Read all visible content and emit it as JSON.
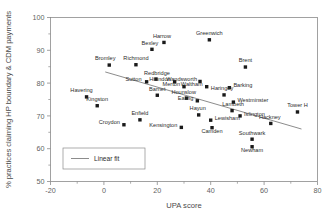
{
  "chart_data": {
    "type": "scatter",
    "title": "",
    "xlabel": "UPA score",
    "ylabel": "% practices claiming HP boundary & CDM payments",
    "xlim": [
      -20,
      80
    ],
    "ylim": [
      50,
      100
    ],
    "xticks": [
      -20,
      0,
      20,
      40,
      60,
      80
    ],
    "xtick_labels": [
      "-20",
      "0",
      "20",
      "40",
      "60",
      "80"
    ],
    "xminor": [
      -10,
      10,
      30,
      50,
      70
    ],
    "yticks": [
      50,
      60,
      70,
      80,
      90,
      100
    ],
    "ytick_labels": [
      "50",
      "60",
      "70",
      "80",
      "90",
      "100"
    ],
    "yminor": [
      55,
      65,
      75,
      85,
      95
    ],
    "grid": false,
    "legend": {
      "position": "lower-left",
      "entries": [
        {
          "label": "Linear fit",
          "marker": "line",
          "color": "#6e6e6e"
        }
      ]
    },
    "marker_style": {
      "shape": "square",
      "color": "#1a1a1a",
      "size": 3.4
    },
    "points": [
      {
        "name": "Harrow",
        "x": 22.5,
        "y": 92.4,
        "label_dx": -2,
        "label_dy": -4.6,
        "anchor": "middle"
      },
      {
        "name": "Bexley",
        "x": 18.0,
        "y": 90.3,
        "label_dx": -2,
        "label_dy": -4.6,
        "anchor": "middle"
      },
      {
        "name": "Greenwich",
        "x": 39.5,
        "y": 93.2,
        "label_dx": 0,
        "label_dy": -4.6,
        "anchor": "middle"
      },
      {
        "name": "Richmond",
        "x": 12.0,
        "y": 85.6,
        "label_dx": 0,
        "label_dy": -4.6,
        "anchor": "middle"
      },
      {
        "name": "Bromley",
        "x": 2.0,
        "y": 85.5,
        "label_dx": -4,
        "label_dy": -4.6,
        "anchor": "middle"
      },
      {
        "name": "Brent",
        "x": 53.0,
        "y": 84.9,
        "label_dx": 0,
        "label_dy": -4.6,
        "anchor": "middle"
      },
      {
        "name": "Redbridge",
        "x": 19.5,
        "y": 81.2,
        "label_dx": 1,
        "label_dy": -4.6,
        "anchor": "middle"
      },
      {
        "name": "Sutton",
        "x": 16.0,
        "y": 80.4,
        "label_dx": -5,
        "label_dy": -0.4,
        "anchor": "end"
      },
      {
        "name": "Hillindon",
        "x": 26.5,
        "y": 80.4,
        "label_dx": -4,
        "label_dy": -0.4,
        "anchor": "end"
      },
      {
        "name": "Wandsworth",
        "x": 36.0,
        "y": 80.5,
        "label_dx": -3,
        "label_dy": -0.4,
        "anchor": "end"
      },
      {
        "name": "Merton",
        "x": 30.0,
        "y": 78.9,
        "label_dx": -4,
        "label_dy": -0.4,
        "anchor": "end"
      },
      {
        "name": "Waltham",
        "x": 38.5,
        "y": 78.9,
        "label_dx": -4,
        "label_dy": -0.4,
        "anchor": "end"
      },
      {
        "name": "Barking",
        "x": 47.0,
        "y": 78.6,
        "label_dx": 4,
        "label_dy": -0.4,
        "anchor": "start"
      },
      {
        "name": "Barnet",
        "x": 20.0,
        "y": 76.3,
        "label_dx": 0,
        "label_dy": -4.6,
        "anchor": "middle"
      },
      {
        "name": "Hounslow",
        "x": 31.0,
        "y": 75.4,
        "label_dx": -3,
        "label_dy": -4.6,
        "anchor": "middle"
      },
      {
        "name": "Ealing",
        "x": 35.0,
        "y": 74.6,
        "label_dx": -4,
        "label_dy": -0.4,
        "anchor": "end"
      },
      {
        "name": "Haringey",
        "x": 45.0,
        "y": 76.4,
        "label_dx": -2,
        "label_dy": -4.6,
        "anchor": "middle"
      },
      {
        "name": "Westminster",
        "x": 48.5,
        "y": 74.2,
        "label_dx": 4,
        "label_dy": -0.4,
        "anchor": "start"
      },
      {
        "name": "Havering",
        "x": -6.5,
        "y": 75.8,
        "label_dx": -5,
        "label_dy": -4.6,
        "anchor": "middle"
      },
      {
        "name": "Kingston",
        "x": -2.5,
        "y": 73.1,
        "label_dx": 0,
        "label_dy": -4.6,
        "anchor": "middle"
      },
      {
        "name": "Enfield",
        "x": 13.5,
        "y": 68.8,
        "label_dx": 0,
        "label_dy": -4.6,
        "anchor": "middle"
      },
      {
        "name": "Croydon",
        "x": 7.5,
        "y": 67.3,
        "label_dx": -4,
        "label_dy": -0.4,
        "anchor": "end"
      },
      {
        "name": "Kensington",
        "x": 29.0,
        "y": 66.5,
        "label_dx": -4,
        "label_dy": -0.4,
        "anchor": "end"
      },
      {
        "name": "Hayun",
        "x": 35.5,
        "y": 70.3,
        "label_dx": -1,
        "label_dy": -4.6,
        "anchor": "middle"
      },
      {
        "name": "Lewisham",
        "x": 40.0,
        "y": 68.7,
        "label_dx": 4,
        "label_dy": -0.4,
        "anchor": "start"
      },
      {
        "name": "Camden",
        "x": 40.5,
        "y": 66.4,
        "label_dx": 0,
        "label_dy": 5.4,
        "anchor": "middle"
      },
      {
        "name": "Lambeth",
        "x": 48.0,
        "y": 71.6,
        "label_dx": 1,
        "label_dy": -4.6,
        "anchor": "middle"
      },
      {
        "name": "Islington",
        "x": 51.0,
        "y": 70.0,
        "label_dx": 4,
        "label_dy": -0.4,
        "anchor": "start"
      },
      {
        "name": "Hackney",
        "x": 62.5,
        "y": 67.7,
        "label_dx": -1,
        "label_dy": -4.6,
        "anchor": "middle"
      },
      {
        "name": "Tower H",
        "x": 72.5,
        "y": 71.2,
        "label_dx": 0,
        "label_dy": -4.6,
        "anchor": "middle"
      },
      {
        "name": "Southwark",
        "x": 55.5,
        "y": 62.9,
        "label_dx": 0,
        "label_dy": -4.6,
        "anchor": "middle"
      },
      {
        "name": "Newham",
        "x": 55.5,
        "y": 60.6,
        "label_dx": 0,
        "label_dy": 5.4,
        "anchor": "middle"
      }
    ],
    "fit": {
      "name": "Linear fit",
      "x_start": 0.5,
      "y_start": 83.4,
      "x_end": 74.0,
      "y_end": 66.0
    }
  }
}
